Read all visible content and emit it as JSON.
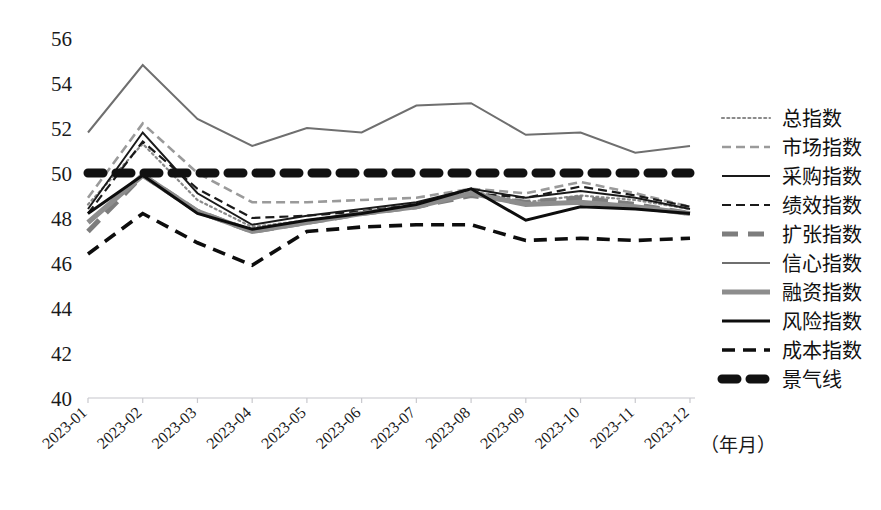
{
  "chart_data": {
    "type": "line",
    "title": "",
    "xlabel": "（年月）",
    "ylabel": "",
    "ylim": [
      40,
      56
    ],
    "yticks": [
      40,
      42,
      44,
      46,
      48,
      50,
      52,
      54,
      56
    ],
    "grid": false,
    "legend_position": "right",
    "categories": [
      "2023-01",
      "2023-02",
      "2023-03",
      "2023-04",
      "2023-05",
      "2023-06",
      "2023-07",
      "2023-08",
      "2023-09",
      "2023-10",
      "2023-11",
      "2023-12"
    ],
    "series": [
      {
        "name": "总指数",
        "style": "dotted",
        "color": "#8a8a8a",
        "width": 2.2,
        "values": [
          48.6,
          51.3,
          48.8,
          47.6,
          47.9,
          48.2,
          48.6,
          49.2,
          48.7,
          49.0,
          48.8,
          48.4
        ]
      },
      {
        "name": "市场指数",
        "style": "dashed",
        "color": "#9a9a9a",
        "width": 2.6,
        "values": [
          48.9,
          52.2,
          50.0,
          48.7,
          48.7,
          48.8,
          48.9,
          49.3,
          49.1,
          49.6,
          49.1,
          48.5
        ]
      },
      {
        "name": "采购指数",
        "style": "solid",
        "color": "#1a1a1a",
        "width": 2.0,
        "values": [
          48.4,
          51.8,
          49.1,
          47.7,
          48.1,
          48.4,
          48.7,
          49.3,
          48.9,
          49.2,
          48.9,
          48.4
        ]
      },
      {
        "name": "绩效指数",
        "style": "dashed",
        "color": "#1a1a1a",
        "width": 2.2,
        "values": [
          48.2,
          51.4,
          49.3,
          48.0,
          48.1,
          48.3,
          48.6,
          49.1,
          48.9,
          49.4,
          49.0,
          48.5
        ]
      },
      {
        "name": "扩张指数",
        "style": "dashed-thick",
        "color": "#7d7d7d",
        "width": 5.0,
        "values": [
          47.4,
          49.9,
          48.3,
          47.4,
          47.8,
          48.2,
          48.5,
          49.0,
          48.7,
          48.9,
          48.6,
          48.2
        ]
      },
      {
        "name": "信心指数",
        "style": "solid",
        "color": "#6f6f6f",
        "width": 2.0,
        "values": [
          51.8,
          54.8,
          52.4,
          51.2,
          52.0,
          51.8,
          53.0,
          53.1,
          51.7,
          51.8,
          50.9,
          51.2
        ]
      },
      {
        "name": "融资指数",
        "style": "solid-thick",
        "color": "#8d8d8d",
        "width": 5.0,
        "values": [
          47.8,
          49.9,
          48.3,
          47.4,
          47.8,
          48.2,
          48.5,
          49.1,
          48.6,
          48.7,
          48.5,
          48.2
        ]
      },
      {
        "name": "风险指数",
        "style": "solid-bold",
        "color": "#0d0d0d",
        "width": 3.0,
        "values": [
          48.2,
          49.9,
          48.2,
          47.5,
          47.9,
          48.2,
          48.6,
          49.3,
          47.9,
          48.5,
          48.4,
          48.2
        ]
      },
      {
        "name": "成本指数",
        "style": "dashed-bold",
        "color": "#0d0d0d",
        "width": 3.6,
        "values": [
          46.4,
          48.2,
          46.9,
          45.9,
          47.4,
          47.6,
          47.7,
          47.7,
          47.0,
          47.1,
          47.0,
          47.1
        ]
      }
    ],
    "reference_line": {
      "name": "景气线",
      "style": "dotted-heavy",
      "color": "#111111",
      "width": 9.0,
      "value": 50
    }
  },
  "legend": {
    "items": [
      {
        "label": "总指数"
      },
      {
        "label": "市场指数"
      },
      {
        "label": "采购指数"
      },
      {
        "label": "绩效指数"
      },
      {
        "label": "扩张指数"
      },
      {
        "label": "信心指数"
      },
      {
        "label": "融资指数"
      },
      {
        "label": "风险指数"
      },
      {
        "label": "成本指数"
      },
      {
        "label": "景气线"
      }
    ]
  },
  "axis": {
    "x_title": "（年月）"
  }
}
